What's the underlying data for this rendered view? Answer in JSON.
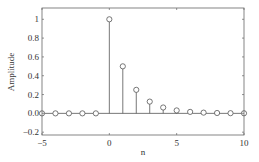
{
  "chart_data": {
    "type": "stem",
    "title": "",
    "xlabel": "n",
    "ylabel": "Amplitude",
    "xlim": [
      -5,
      10
    ],
    "ylim": [
      -0.23,
      1.12
    ],
    "xticks": [
      -5,
      0,
      5,
      10
    ],
    "xtick_labels": [
      "−5",
      "0",
      "5",
      "10"
    ],
    "yticks": [
      -0.2,
      0,
      0.2,
      0.4,
      0.6,
      0.8,
      1
    ],
    "ytick_labels": [
      "−0.2",
      "0.0",
      "0.2",
      "0.4",
      "0.6",
      "0.8",
      "1"
    ],
    "grid": false,
    "legend": null,
    "x": [
      -5,
      -4,
      -3,
      -2,
      -1,
      0,
      1,
      2,
      3,
      4,
      5,
      6,
      7,
      8,
      9,
      10
    ],
    "values": [
      0,
      0,
      0,
      0,
      0,
      1,
      0.5,
      0.25,
      0.125,
      0.0625,
      0.03125,
      0.015625,
      0.0078125,
      0.00390625,
      0.001953125,
      0.0009765625
    ],
    "marker": "circle-open",
    "color": "#555555"
  }
}
